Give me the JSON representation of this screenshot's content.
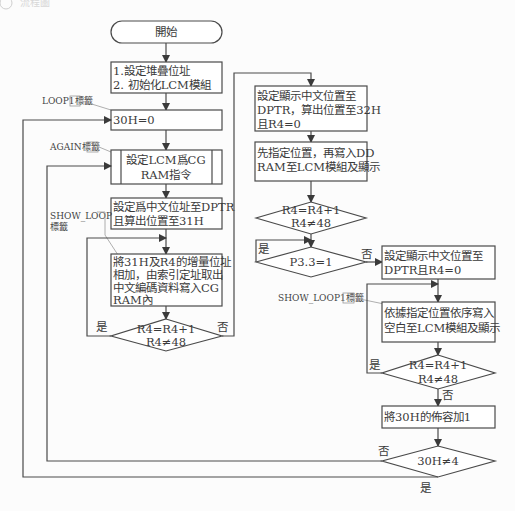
{
  "header": {
    "icon": "circled-number-icon",
    "number": "2",
    "title": "流程圖"
  },
  "flowchart": {
    "start": "開始",
    "init": [
      "1.設定堆疊位址",
      "2. 初始化LCM模組"
    ],
    "loop1_label": "LOOP1標籤",
    "set_30h": "30H=0",
    "again_label": "AGAIN標籤",
    "cgram_cmd": [
      "設定LCM爲CG",
      "RAM指令"
    ],
    "set_dptr": [
      "設定爲中文位址至DPTR",
      "且算出位置至31H"
    ],
    "show_loop_label": [
      "SHOW_LOOP",
      "標籤"
    ],
    "write_cgram": [
      "將31H及R4的增量位址",
      "相加，由索引定址取出",
      "中文編碼資料寫入CG",
      "RAM內"
    ],
    "decision1": [
      "R4=R4+1",
      "R4≠48"
    ],
    "decision1_yes": "是",
    "decision1_no": "否",
    "set_display_pos": [
      "設定顯示中文位置至",
      "DPTR，算出位置至32H",
      "且R4=0"
    ],
    "write_ddram": [
      "先指定位置，再寫入DD",
      "RAM至LCM模組及顯示"
    ],
    "decision2": [
      "R4=R4+1",
      "R4≠48"
    ],
    "decision3": "P3.3=1",
    "decision3_yes": "是",
    "decision3_no": "否",
    "set_display_pos2": [
      "設定顯示中文位置至",
      "DPTR且R4=0"
    ],
    "show_loop1_label": "SHOW_LOOP1標籤",
    "write_blank": [
      "依據指定位置依序寫入",
      "空白至LCM模組及顯示"
    ],
    "decision4": [
      "R4=R4+1",
      "R4≠48"
    ],
    "decision4_yes": "是",
    "decision4_no": "否",
    "inc_30h": "將30H的佈容加1",
    "decision5": "30H≠4",
    "decision5_yes": "是",
    "decision5_no": "否"
  }
}
